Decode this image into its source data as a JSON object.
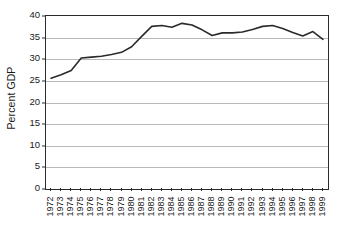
{
  "chart_data": {
    "type": "line",
    "title": "",
    "subtitle": "",
    "xlabel": "",
    "ylabel": "Percent GDP",
    "ylim": [
      0,
      40
    ],
    "yticks": [
      0,
      5,
      10,
      15,
      20,
      25,
      30,
      35,
      40
    ],
    "ytick_labels": [
      "0",
      "5",
      "10",
      "15",
      "20",
      "25",
      "30",
      "35",
      "40"
    ],
    "grid": true,
    "grid_axis": "y",
    "legend": false,
    "legend_position": "none",
    "annotations": [],
    "categories": [
      "1972",
      "1973",
      "1974",
      "1975",
      "1976",
      "1977",
      "1978",
      "1979",
      "1980",
      "1981",
      "1982",
      "1983",
      "1984",
      "1985",
      "1986",
      "1987",
      "1988",
      "1989",
      "1990",
      "1991",
      "1992",
      "1993",
      "1994",
      "1995",
      "1996",
      "1997",
      "1998",
      "1999"
    ],
    "x": [
      1972,
      1973,
      1974,
      1975,
      1976,
      1977,
      1978,
      1979,
      1980,
      1981,
      1982,
      1983,
      1984,
      1985,
      1986,
      1987,
      1988,
      1989,
      1990,
      1991,
      1992,
      1993,
      1994,
      1995,
      1996,
      1997,
      1998,
      1999
    ],
    "values": [
      25.6,
      26.4,
      27.4,
      30.3,
      30.5,
      30.7,
      31.1,
      31.6,
      32.9,
      35.3,
      37.6,
      37.8,
      37.4,
      38.3,
      37.9,
      36.8,
      35.5,
      36.1,
      36.1,
      36.3,
      36.9,
      37.6,
      37.8,
      37.1,
      36.2,
      35.4,
      36.4,
      34.6
    ],
    "series": [
      {
        "name": "Percent GDP",
        "color": "#2b2b2b",
        "line_width": 1.6,
        "marker": "none",
        "values": [
          25.6,
          26.4,
          27.4,
          30.3,
          30.5,
          30.7,
          31.1,
          31.6,
          32.9,
          35.3,
          37.6,
          37.8,
          37.4,
          38.3,
          37.9,
          36.8,
          35.5,
          36.1,
          36.1,
          36.3,
          36.9,
          37.6,
          37.8,
          37.1,
          36.2,
          35.4,
          36.4,
          34.6
        ]
      }
    ],
    "colors": {
      "line": "#2b2b2b",
      "gridline": "#b9b9b9",
      "axis": "#2b2b2b",
      "background": "#ffffff",
      "text": "#1a1a1a"
    }
  }
}
